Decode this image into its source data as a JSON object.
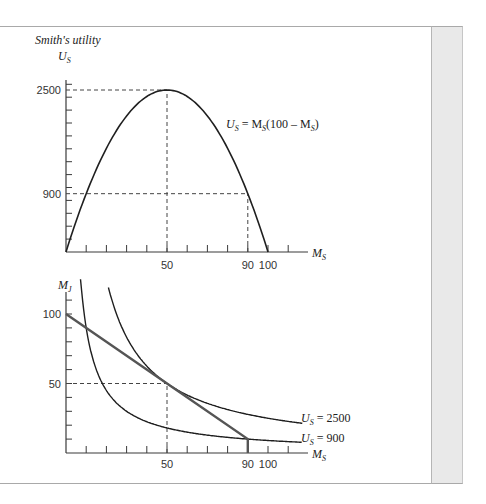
{
  "colors": {
    "axis": "#3a3a3a",
    "curve": "#1f1f1f",
    "budget_line": "#555555",
    "dashed": "#444444",
    "panel": "#e9e9e9"
  },
  "top_chart": {
    "title": "Smith's utility",
    "ylabel_main": "U",
    "ylabel_sub": "S",
    "xlabel_main": "M",
    "xlabel_sub": "S",
    "y_ticks_labeled": [
      {
        "value": 2500,
        "label": "2500"
      },
      {
        "value": 900,
        "label": "900"
      }
    ],
    "x_ticks_labeled": [
      {
        "value": 50,
        "label": "50"
      },
      {
        "value": 90,
        "label": "90"
      },
      {
        "value": 100,
        "label": "100"
      }
    ],
    "curve_label": {
      "p1": "U",
      "s1": "S",
      "p2": " = M",
      "s2": "S",
      "p3": "(100 – M",
      "s3": "S",
      "p4": ")"
    }
  },
  "bottom_chart": {
    "ylabel_main": "M",
    "ylabel_sub": "J",
    "xlabel_main": "M",
    "xlabel_sub": "S",
    "y_ticks_labeled": [
      {
        "value": 100,
        "label": "100"
      },
      {
        "value": 50,
        "label": "50"
      }
    ],
    "x_ticks_labeled": [
      {
        "value": 50,
        "label": "50"
      },
      {
        "value": 90,
        "label": "90"
      },
      {
        "value": 100,
        "label": "100"
      }
    ],
    "curve_labels": [
      {
        "main": "U",
        "sub": "S",
        "rest": " = 2500"
      },
      {
        "main": "U",
        "sub": "S",
        "rest": " = 900"
      }
    ]
  },
  "chart_data": [
    {
      "type": "line",
      "title": "Smith's utility",
      "xlabel": "M_S",
      "ylabel": "U_S",
      "series": [
        {
          "name": "U_S = M_S(100 – M_S)",
          "function": "x*(100-x)",
          "x": [
            0,
            10,
            20,
            30,
            40,
            50,
            60,
            70,
            80,
            90,
            100
          ],
          "values": [
            0,
            900,
            1600,
            2100,
            2400,
            2500,
            2400,
            2100,
            1600,
            900,
            0
          ]
        }
      ],
      "reference_lines": [
        {
          "type": "dashed",
          "from": [
            0,
            2500
          ],
          "to": [
            50,
            2500
          ]
        },
        {
          "type": "dashed",
          "from": [
            50,
            0
          ],
          "to": [
            50,
            2500
          ]
        },
        {
          "type": "dashed",
          "from": [
            0,
            900
          ],
          "to": [
            90,
            900
          ]
        },
        {
          "type": "dashed",
          "from": [
            90,
            0
          ],
          "to": [
            90,
            900
          ]
        }
      ],
      "y_ticks": [
        2500,
        900
      ],
      "x_ticks": [
        50,
        90,
        100
      ],
      "xlim": [
        0,
        120
      ],
      "ylim": [
        0,
        2600
      ],
      "grid": false
    },
    {
      "type": "line",
      "title": "",
      "xlabel": "M_S",
      "ylabel": "M_J",
      "series": [
        {
          "name": "U_S = 2500",
          "function": "2500/x",
          "x": [
            25,
            30,
            40,
            50,
            60,
            80,
            100,
            117
          ],
          "values": [
            100,
            83.3,
            62.5,
            50,
            41.7,
            31.3,
            25,
            21.4
          ]
        },
        {
          "name": "U_S = 900",
          "function": "900/x",
          "x": [
            7.5,
            10,
            15,
            20,
            30,
            50,
            90,
            117
          ],
          "values": [
            120,
            90,
            60,
            45,
            30,
            18,
            10,
            7.7
          ]
        },
        {
          "name": "budget line",
          "x": [
            0,
            50,
            90,
            90
          ],
          "values": [
            100,
            50,
            10,
            0
          ]
        }
      ],
      "reference_lines": [
        {
          "type": "dashed",
          "from": [
            0,
            50
          ],
          "to": [
            50,
            50
          ]
        },
        {
          "type": "dashed",
          "from": [
            50,
            0
          ],
          "to": [
            50,
            50
          ]
        }
      ],
      "y_ticks": [
        100,
        50
      ],
      "x_ticks": [
        50,
        90,
        100
      ],
      "xlim": [
        0,
        120
      ],
      "ylim": [
        0,
        115
      ],
      "grid": false
    }
  ]
}
